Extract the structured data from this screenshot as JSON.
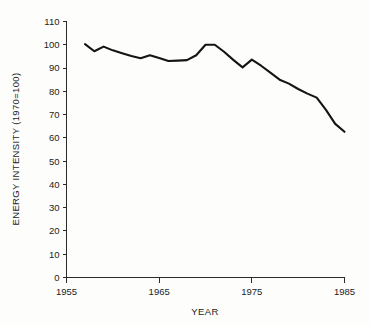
{
  "chart_data": {
    "type": "line",
    "title": "",
    "xlabel": "YEAR",
    "ylabel": "ENERGY INTENSITY (1970=100)",
    "xlim": [
      1955,
      1985
    ],
    "ylim": [
      0,
      110
    ],
    "xticks": [
      "1955",
      "1965",
      "1975",
      "1985"
    ],
    "xtick_values": [
      1955,
      1965,
      1975,
      1985
    ],
    "yticks": [
      "0",
      "10",
      "20",
      "30",
      "40",
      "50",
      "60",
      "70",
      "80",
      "90",
      "100",
      "110"
    ],
    "ytick_values": [
      0,
      10,
      20,
      30,
      40,
      50,
      60,
      70,
      80,
      90,
      100,
      110
    ],
    "grid": false,
    "legend": "none",
    "line_color": "#141414",
    "x": [
      1957,
      1958,
      1959,
      1960,
      1961,
      1962,
      1963,
      1964,
      1965,
      1966,
      1967,
      1968,
      1969,
      1970,
      1971,
      1972,
      1973,
      1974,
      1975,
      1976,
      1977,
      1978,
      1979,
      1980,
      1981,
      1982,
      1983,
      1984,
      1985
    ],
    "values": [
      100.3,
      97.2,
      99.2,
      97.6,
      96.4,
      95.2,
      94.2,
      95.5,
      94.3,
      93.0,
      93.2,
      93.4,
      95.5,
      100.0,
      100.0,
      97.0,
      93.5,
      90.3,
      93.6,
      91.0,
      88.0,
      85.0,
      83.3,
      81.0,
      79.0,
      77.3,
      72.0,
      66.0,
      65.5
    ],
    "endpoint_value": 62.6
  },
  "axis": {
    "x_axis_name": "x-axis",
    "y_axis_name": "y-axis"
  }
}
